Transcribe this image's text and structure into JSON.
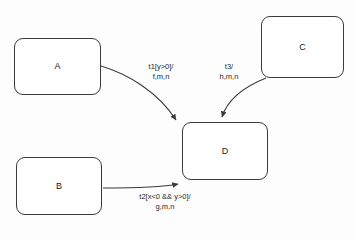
{
  "diagram": {
    "type": "state-transition-diagram",
    "background_color": "#fdfdfd",
    "stroke_color": "#3b3b3b",
    "text_color": "#222222",
    "states": [
      {
        "id": "A",
        "label": "A",
        "x": 14,
        "y": 38,
        "w": 87,
        "h": 57
      },
      {
        "id": "B",
        "label": "B",
        "x": 16,
        "y": 157,
        "w": 86,
        "h": 58
      },
      {
        "id": "C",
        "label": "C",
        "x": 261,
        "y": 16,
        "w": 83,
        "h": 62
      },
      {
        "id": "D",
        "label": "D",
        "x": 182,
        "y": 122,
        "w": 86,
        "h": 58
      }
    ],
    "transitions": [
      {
        "id": "t1",
        "from": "A",
        "to": "D",
        "trigger": "t1",
        "guard": "[y>0]",
        "actions": "f,m,n",
        "label_lines": [
          "t1[y>0]/",
          "f,m,n"
        ],
        "label_x": 161,
        "label_y": 62,
        "path": "M 101 66 C 128 74, 158 92, 176 120",
        "arrow_at": {
          "x": 180,
          "y": 125
        }
      },
      {
        "id": "t3",
        "from": "C",
        "to": "D",
        "trigger": "t3",
        "guard": "",
        "actions": "h,m,n",
        "label_lines": [
          "t3/",
          "h,m,n"
        ],
        "label_x": 229,
        "label_y": 62,
        "path": "M 266 78 C 246 86, 228 98, 222 117",
        "arrow_at": {
          "x": 222,
          "y": 121
        }
      },
      {
        "id": "t2",
        "from": "B",
        "to": "D",
        "trigger": "t2",
        "guard": "[x<0 && y>0]",
        "actions": "g,m,n",
        "label_lines": [
          "t2[x<0 && y>0]/",
          "g,m,n"
        ],
        "label_x": 165,
        "label_y": 192,
        "path": "M 103 188 C 140 188, 168 186, 178 184",
        "arrow_at": {
          "x": 182,
          "y": 180
        }
      }
    ]
  }
}
